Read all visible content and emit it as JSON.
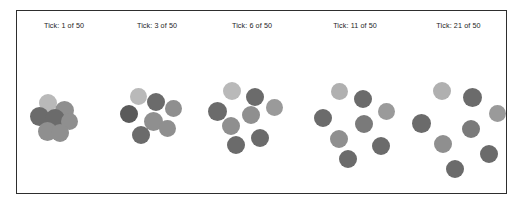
{
  "window": {
    "title": "Particle Dispersion Simulation",
    "background_color": "#ffffff",
    "frame_color": "#2e2e2e"
  },
  "palette": {
    "light_gray": "#b9b9b9",
    "mid_gray": "#8f8f8f",
    "dark_gray": "#6b6b6b",
    "darker_gray": "#5a5a5a",
    "label_color": "#1d1d1d"
  },
  "chart_data": {
    "type": "scatter",
    "title": "",
    "xlabel": "",
    "ylabel": "",
    "grid": false,
    "legend": null,
    "total_ticks": 50,
    "panels": [
      {
        "label": "Tick: 1 of 50",
        "tick": 1,
        "panel_left_px": 0,
        "panel_width_px": 94,
        "particle_count": 7,
        "spread": "tight",
        "points": [
          {
            "x": 31,
            "y": 34,
            "r": 9.0,
            "color": "#b9b9b9"
          },
          {
            "x": 47,
            "y": 41,
            "r": 9.5,
            "color": "#8f8f8f"
          },
          {
            "x": 22,
            "y": 47,
            "r": 9.5,
            "color": "#6b6b6b"
          },
          {
            "x": 38,
            "y": 50,
            "r": 10.0,
            "color": "#6b6b6b"
          },
          {
            "x": 52,
            "y": 52,
            "r": 8.5,
            "color": "#8f8f8f"
          },
          {
            "x": 30,
            "y": 62,
            "r": 9.5,
            "color": "#8f8f8f"
          },
          {
            "x": 43,
            "y": 64,
            "r": 9.0,
            "color": "#8f8f8f"
          }
        ]
      },
      {
        "label": "Tick: 3 of 50",
        "tick": 3,
        "panel_left_px": 94,
        "panel_width_px": 92,
        "particle_count": 7,
        "spread": "tight-medium",
        "points": [
          {
            "x": 27,
            "y": 27,
            "r": 8.5,
            "color": "#b9b9b9"
          },
          {
            "x": 45,
            "y": 33,
            "r": 9.0,
            "color": "#6b6b6b"
          },
          {
            "x": 62,
            "y": 39,
            "r": 8.5,
            "color": "#8f8f8f"
          },
          {
            "x": 18,
            "y": 45,
            "r": 9.0,
            "color": "#5a5a5a"
          },
          {
            "x": 42,
            "y": 52,
            "r": 9.5,
            "color": "#8f8f8f"
          },
          {
            "x": 30,
            "y": 66,
            "r": 9.0,
            "color": "#6b6b6b"
          },
          {
            "x": 56,
            "y": 59,
            "r": 8.5,
            "color": "#8f8f8f"
          }
        ]
      },
      {
        "label": "Tick: 6 of 50",
        "tick": 6,
        "panel_left_px": 186,
        "panel_width_px": 98,
        "particle_count": 7,
        "spread": "medium",
        "points": [
          {
            "x": 29,
            "y": 22,
            "r": 9.0,
            "color": "#b9b9b9"
          },
          {
            "x": 52,
            "y": 28,
            "r": 9.0,
            "color": "#6b6b6b"
          },
          {
            "x": 71,
            "y": 38,
            "r": 8.5,
            "color": "#9a9a9a"
          },
          {
            "x": 14,
            "y": 42,
            "r": 9.5,
            "color": "#6b6b6b"
          },
          {
            "x": 48,
            "y": 46,
            "r": 9.0,
            "color": "#8f8f8f"
          },
          {
            "x": 28,
            "y": 57,
            "r": 9.0,
            "color": "#8f8f8f"
          },
          {
            "x": 57,
            "y": 69,
            "r": 9.0,
            "color": "#6b6b6b"
          },
          {
            "x": 33,
            "y": 76,
            "r": 9.0,
            "color": "#6b6b6b"
          }
        ]
      },
      {
        "label": "Tick: 11 of 50",
        "tick": 11,
        "panel_left_px": 284,
        "panel_width_px": 108,
        "particle_count": 8,
        "spread": "wide",
        "points": [
          {
            "x": 38,
            "y": 22,
            "r": 8.5,
            "color": "#b0b0b0"
          },
          {
            "x": 62,
            "y": 30,
            "r": 9.0,
            "color": "#6b6b6b"
          },
          {
            "x": 85,
            "y": 42,
            "r": 8.5,
            "color": "#9a9a9a"
          },
          {
            "x": 22,
            "y": 49,
            "r": 9.0,
            "color": "#6b6b6b"
          },
          {
            "x": 63,
            "y": 55,
            "r": 9.0,
            "color": "#7a7a7a"
          },
          {
            "x": 38,
            "y": 70,
            "r": 9.0,
            "color": "#8f8f8f"
          },
          {
            "x": 80,
            "y": 77,
            "r": 9.0,
            "color": "#6b6b6b"
          },
          {
            "x": 47,
            "y": 90,
            "r": 9.0,
            "color": "#6b6b6b"
          }
        ]
      },
      {
        "label": "Tick: 21 of 50",
        "tick": 21,
        "panel_left_px": 392,
        "panel_width_px": 99,
        "particle_count": 8,
        "spread": "widest",
        "points": [
          {
            "x": 33,
            "y": 22,
            "r": 9.0,
            "color": "#b0b0b0"
          },
          {
            "x": 63,
            "y": 28,
            "r": 9.5,
            "color": "#6b6b6b"
          },
          {
            "x": 88,
            "y": 44,
            "r": 8.5,
            "color": "#9a9a9a"
          },
          {
            "x": 12,
            "y": 54,
            "r": 9.5,
            "color": "#6b6b6b"
          },
          {
            "x": 62,
            "y": 60,
            "r": 9.0,
            "color": "#7a7a7a"
          },
          {
            "x": 34,
            "y": 75,
            "r": 9.0,
            "color": "#8f8f8f"
          },
          {
            "x": 80,
            "y": 85,
            "r": 9.0,
            "color": "#6b6b6b"
          },
          {
            "x": 46,
            "y": 100,
            "r": 9.0,
            "color": "#6b6b6b"
          }
        ]
      }
    ]
  }
}
